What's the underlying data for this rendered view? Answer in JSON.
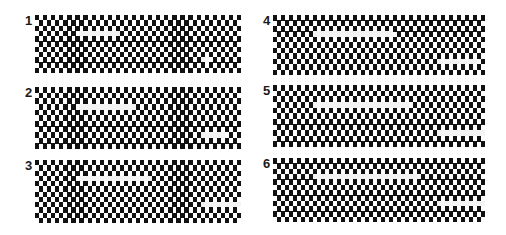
{
  "figure": {
    "grid": {
      "cols": 52,
      "rows": 11,
      "cell_w": 4,
      "cell_h": 5.4,
      "dark_color": "#111111",
      "light_color": "#ffffff",
      "defect_color": "#f4f4f4"
    },
    "panels": [
      {
        "label": "1",
        "x": 35,
        "y": 15,
        "w": 206,
        "h": 58,
        "defects": [
          {
            "col": 11,
            "row": 3,
            "len": 5
          },
          {
            "col": 41,
            "row": 8,
            "len": 1
          }
        ]
      },
      {
        "label": "2",
        "x": 35,
        "y": 87,
        "w": 206,
        "h": 62,
        "defects": [
          {
            "col": 11,
            "row": 3,
            "len": 7
          },
          {
            "col": 41,
            "row": 8,
            "len": 3
          }
        ]
      },
      {
        "label": "3",
        "x": 35,
        "y": 160,
        "w": 206,
        "h": 63,
        "defects": [
          {
            "col": 11,
            "row": 3,
            "len": 9
          },
          {
            "col": 41,
            "row": 8,
            "len": 5
          }
        ]
      },
      {
        "label": "4",
        "x": 273,
        "y": 15,
        "w": 212,
        "h": 60,
        "defects": [
          {
            "col": 10,
            "row": 3,
            "len": 10
          },
          {
            "col": 41,
            "row": 8,
            "len": 5
          }
        ]
      },
      {
        "label": "5",
        "x": 273,
        "y": 85,
        "w": 212,
        "h": 62,
        "defects": [
          {
            "col": 10,
            "row": 3,
            "len": 12
          },
          {
            "col": 41,
            "row": 8,
            "len": 7
          }
        ]
      },
      {
        "label": "6",
        "x": 273,
        "y": 158,
        "w": 212,
        "h": 64,
        "defects": [
          {
            "col": 10,
            "row": 3,
            "len": 13
          },
          {
            "col": 41,
            "row": 8,
            "len": 8
          }
        ]
      }
    ]
  }
}
